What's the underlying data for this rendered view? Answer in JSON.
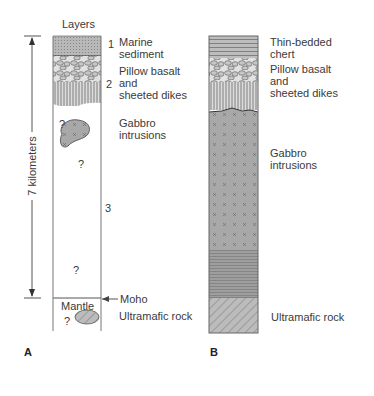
{
  "figure": {
    "panel_a": {
      "letter": "A",
      "header": "Layers",
      "scale_label": "7 kilometers",
      "layers": [
        {
          "number": "1",
          "label": "Marine\nsediment"
        },
        {
          "number": "2",
          "label": "Pillow basalt\nand\nsheeted dikes"
        },
        {
          "number": "",
          "label": "Gabbro\nintrusions"
        },
        {
          "number": "3",
          "label": ""
        }
      ],
      "moho_label": "Moho",
      "mantle_label": "Mantle",
      "ultramafic_label": "Ultramafic rock",
      "unknown_marker": "?"
    },
    "panel_b": {
      "letter": "B",
      "layers": [
        {
          "label": "Thin-bedded\nchert"
        },
        {
          "label": "Pillow basalt\nand\nsheeted dikes"
        },
        {
          "label": "Gabbro\nintrusions"
        },
        {
          "label": "Ultramafic rock"
        }
      ]
    },
    "colors": {
      "sediment": "#b5b5b5",
      "gabbro": "#a9a9a9",
      "ultramafic": "#bdbdbd",
      "line": "#555555"
    }
  }
}
